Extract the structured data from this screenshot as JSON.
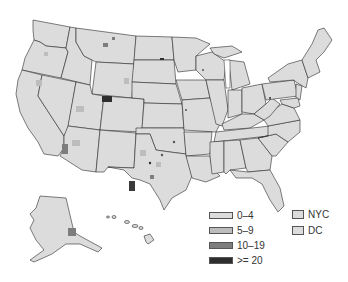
{
  "map": {
    "title": "",
    "region": "United States",
    "base_fill": "#dcdcdc",
    "border_color": "#2a2a2a"
  },
  "legend": {
    "bins": [
      {
        "label": "0–4",
        "color": "#dcdcdc"
      },
      {
        "label": "5–9",
        "color": "#bdbdbd"
      },
      {
        "label": "10–19",
        "color": "#7d7d7d"
      },
      {
        "label": ">= 20",
        "color": "#2e2e2e"
      }
    ],
    "insets": [
      {
        "label": "NYC",
        "color": "#dcdcdc"
      },
      {
        "label": "DC",
        "color": "#dcdcdc"
      }
    ]
  }
}
